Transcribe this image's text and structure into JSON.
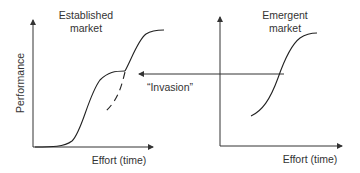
{
  "diagram": {
    "left_panel": {
      "title_line1": "Established",
      "title_line2": "market",
      "y_label": "Performance",
      "x_label": "Effort (time)",
      "curves": [
        "established S-curve",
        "new technology S-curve (continuing)",
        "new technology S-curve (dashed projection)"
      ]
    },
    "right_panel": {
      "title_line1": "Emergent",
      "title_line2": "market",
      "x_label": "Effort (time)",
      "curves": [
        "emergent S-curve"
      ]
    },
    "arrow": {
      "label": "“Invasion”",
      "direction": "right-to-left"
    },
    "colors": {
      "stroke": "#222222",
      "text": "#333333",
      "background": "#ffffff"
    }
  }
}
